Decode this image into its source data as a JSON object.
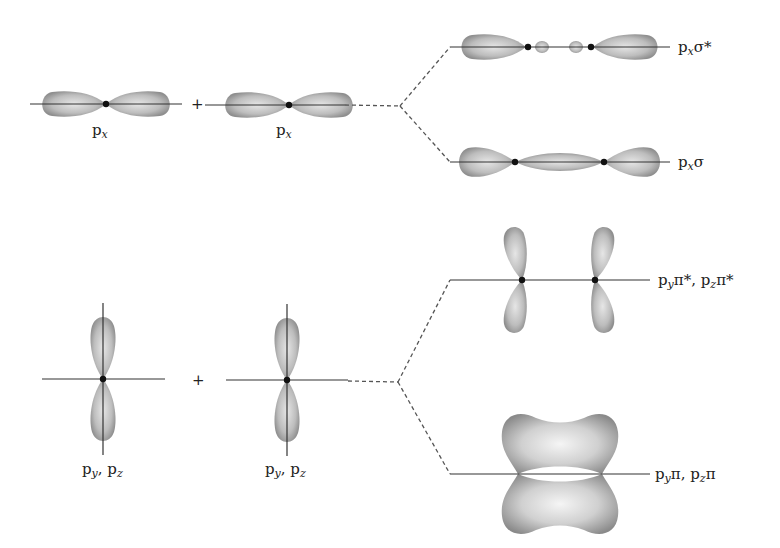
{
  "atomic_orbitals": {
    "px_left": {
      "base": "p",
      "sub": "x"
    },
    "px_right": {
      "base": "p",
      "sub": "x"
    },
    "pypz_left": {
      "parts": [
        {
          "base": "p",
          "sub": "y"
        },
        {
          "base": ", p",
          "sub": "z"
        }
      ]
    },
    "pypz_right": {
      "parts": [
        {
          "base": "p",
          "sub": "y"
        },
        {
          "base": ", p",
          "sub": "z"
        }
      ]
    },
    "plus_sign": "+"
  },
  "molecular_orbitals": {
    "sigma_star": {
      "base": "p",
      "sub": "x",
      "suffix": "σ*"
    },
    "sigma": {
      "base": "p",
      "sub": "x",
      "suffix": "σ"
    },
    "pi_star": {
      "p1": "p",
      "s1": "y",
      "t1": "π*, p",
      "s2": "z",
      "t2": "π*"
    },
    "pi": {
      "p1": "p",
      "s1": "y",
      "t1": "π, p",
      "s2": "z",
      "t2": "π"
    }
  },
  "colors": {
    "lobe": "#9a9a9a",
    "line": "#333333",
    "nucleus": "#111111"
  }
}
